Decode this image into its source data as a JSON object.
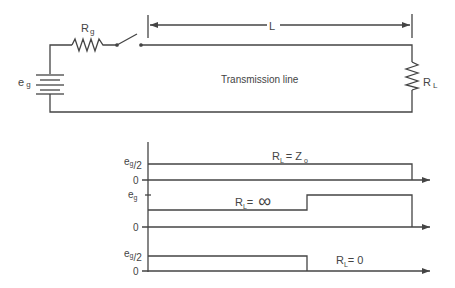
{
  "circuit": {
    "source_label": "e",
    "source_sub": "g",
    "source_resistor_label": "R",
    "source_resistor_sub": "g",
    "length_label": "L",
    "line_label": "Transmission line",
    "load_label": "R",
    "load_sub": "L"
  },
  "waveforms": [
    {
      "name": "matched",
      "level_label": "e",
      "level_sub": "g",
      "level_frac": "/2",
      "zero_label": "0",
      "condition": "R",
      "condition_sub": "L",
      "condition_eq": "= Z",
      "condition_eq_sub": "o"
    },
    {
      "name": "open",
      "level_label": "e",
      "level_sub": "g",
      "zero_label": "0",
      "condition": "R",
      "condition_sub": "L",
      "condition_eq": "=",
      "condition_value": "∞"
    },
    {
      "name": "short",
      "level_label": "e",
      "level_sub": "g",
      "level_frac": "/2",
      "zero_label": "0",
      "condition": "R",
      "condition_sub": "L",
      "condition_eq": "= 0"
    }
  ],
  "colors": {
    "line": "#444444",
    "text": "#444444"
  }
}
